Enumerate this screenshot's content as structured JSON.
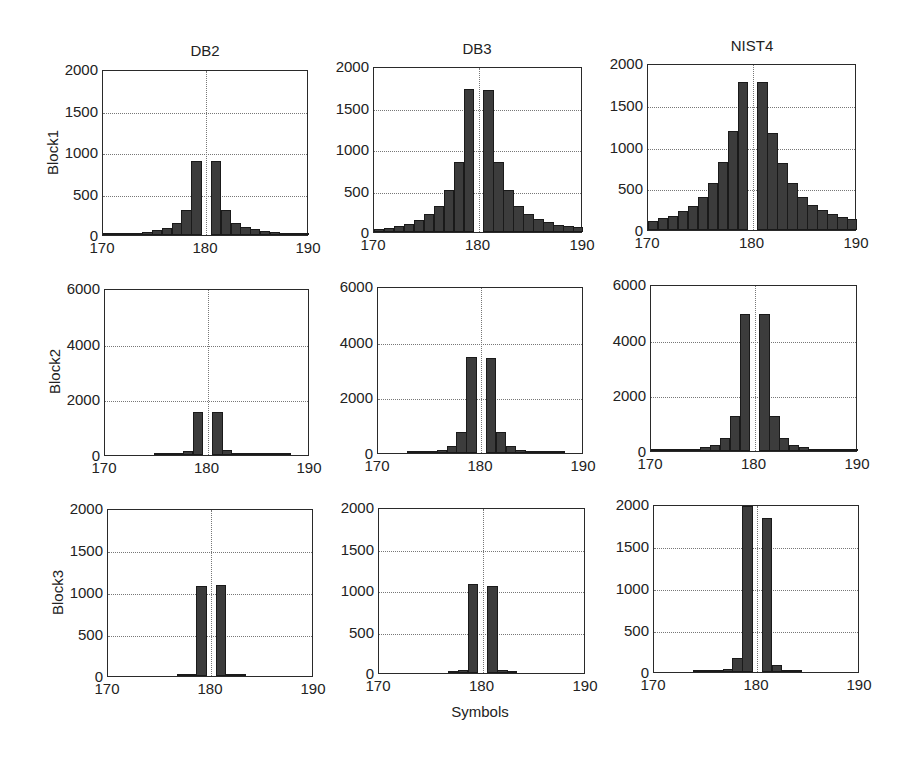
{
  "figure": {
    "column_titles": [
      "DB2",
      "DB3",
      "NIST4"
    ],
    "row_labels": [
      "Block1",
      "Block2",
      "Block3"
    ],
    "xlabel": "Symbols"
  },
  "chart_data": {
    "type": "bar",
    "layout": "3x3 grid of histograms",
    "xlabel": "Symbols",
    "x": [
      170,
      171,
      172,
      173,
      174,
      175,
      176,
      177,
      178,
      179,
      180,
      181,
      182,
      183,
      184,
      185,
      186,
      187,
      188,
      189,
      190
    ],
    "xticks": [
      170,
      180,
      190
    ],
    "grid": true,
    "panels": [
      {
        "row": "Block1",
        "col": "DB2",
        "ylim": [
          0,
          2000
        ],
        "yticks": [
          0,
          500,
          1000,
          1500,
          2000
        ],
        "values": [
          10,
          15,
          20,
          30,
          40,
          60,
          90,
          150,
          310,
          900,
          0,
          900,
          310,
          150,
          100,
          70,
          50,
          35,
          25,
          20,
          15
        ]
      },
      {
        "row": "Block1",
        "col": "DB3",
        "ylim": [
          0,
          2000
        ],
        "yticks": [
          0,
          500,
          1000,
          1500,
          2000
        ],
        "values": [
          40,
          55,
          75,
          100,
          150,
          220,
          320,
          510,
          850,
          1740,
          0,
          1730,
          850,
          510,
          320,
          220,
          160,
          120,
          90,
          75,
          60
        ]
      },
      {
        "row": "Block1",
        "col": "NIST4",
        "ylim": [
          0,
          2000
        ],
        "yticks": [
          0,
          500,
          1000,
          1500,
          2000
        ],
        "values": [
          110,
          140,
          170,
          230,
          290,
          400,
          570,
          820,
          1200,
          1800,
          0,
          1800,
          1180,
          810,
          570,
          400,
          300,
          240,
          190,
          160,
          130
        ]
      },
      {
        "row": "Block2",
        "col": "DB2",
        "ylim": [
          0,
          6000
        ],
        "yticks": [
          0,
          2000,
          4000,
          6000
        ],
        "values": [
          0,
          0,
          0,
          0,
          0,
          5,
          10,
          30,
          160,
          1550,
          0,
          1550,
          170,
          60,
          30,
          15,
          10,
          5,
          5,
          0,
          0
        ]
      },
      {
        "row": "Block2",
        "col": "DB3",
        "ylim": [
          0,
          6000
        ],
        "yticks": [
          0,
          2000,
          4000,
          6000
        ],
        "values": [
          0,
          0,
          0,
          5,
          15,
          40,
          100,
          250,
          750,
          3500,
          0,
          3450,
          760,
          260,
          110,
          50,
          20,
          10,
          5,
          0,
          0
        ]
      },
      {
        "row": "Block2",
        "col": "NIST4",
        "ylim": [
          0,
          6000
        ],
        "yticks": [
          0,
          2000,
          4000,
          6000
        ],
        "values": [
          5,
          10,
          20,
          40,
          80,
          130,
          230,
          470,
          1280,
          5000,
          0,
          4980,
          1280,
          480,
          220,
          130,
          80,
          50,
          30,
          20,
          10
        ]
      },
      {
        "row": "Block3",
        "col": "DB2",
        "ylim": [
          0,
          2000
        ],
        "yticks": [
          0,
          500,
          1000,
          1500,
          2000
        ],
        "values": [
          0,
          0,
          0,
          0,
          0,
          0,
          0,
          5,
          15,
          1090,
          0,
          1100,
          30,
          5,
          0,
          0,
          0,
          0,
          0,
          0,
          0
        ]
      },
      {
        "row": "Block3",
        "col": "DB3",
        "ylim": [
          0,
          2000
        ],
        "yticks": [
          0,
          500,
          1000,
          1500,
          2000
        ],
        "values": [
          0,
          0,
          0,
          0,
          0,
          0,
          0,
          5,
          35,
          1080,
          0,
          1060,
          35,
          5,
          0,
          0,
          0,
          0,
          0,
          0,
          0
        ]
      },
      {
        "row": "Block3",
        "col": "NIST4",
        "ylim": [
          0,
          2000
        ],
        "yticks": [
          0,
          500,
          1000,
          1500,
          2000
        ],
        "values": [
          0,
          0,
          0,
          0,
          10,
          20,
          25,
          40,
          170,
          2000,
          0,
          1850,
          80,
          10,
          5,
          0,
          0,
          0,
          0,
          0,
          0
        ]
      }
    ]
  },
  "colors": {
    "bar_fill": "#3c3c3c",
    "bar_edge": "#1a1a1a",
    "grid": "#777777",
    "axes": "#2a2a2a"
  }
}
